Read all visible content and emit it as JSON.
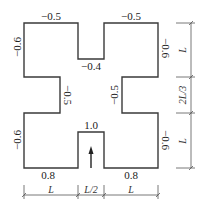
{
  "diagram": {
    "coefficients": {
      "top_left_edge": "−0.5",
      "top_right_edge": "−0.5",
      "top_notch_bottom": "−0.4",
      "left_upper_side": "−0.6",
      "right_upper_side": "−0.6",
      "left_notch_side": "−0.5",
      "right_notch_side": "−0.5",
      "left_lower_side": "−0.6",
      "right_lower_side": "−0.6",
      "bottom_notch_top": "1.0",
      "bottom_left_edge": "0.8",
      "bottom_right_edge": "0.8"
    },
    "wind_arrow": "wind-direction-arrow",
    "dimensions_bottom": [
      "L",
      "L/2",
      "L"
    ],
    "dimensions_right": [
      "L",
      "2L/3",
      "L"
    ]
  }
}
